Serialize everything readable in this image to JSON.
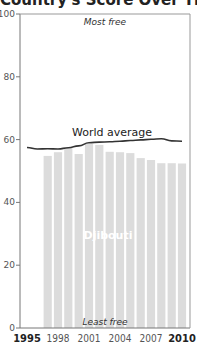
{
  "chart_data": {
    "type": "bar",
    "title": "Country's Score Over Time",
    "xlabel": "",
    "ylabel": "",
    "ylim": [
      0,
      100
    ],
    "yticks": [
      0,
      20,
      40,
      60,
      80,
      100
    ],
    "xtick_labels": [
      "1995",
      "1998",
      "2001",
      "2004",
      "2007",
      "2010"
    ],
    "categories": [
      "1997",
      "1998",
      "1999",
      "2000",
      "2001",
      "2002",
      "2003",
      "2004",
      "2005",
      "2006",
      "2007",
      "2008",
      "2009",
      "2010"
    ],
    "series": [
      {
        "name": "Djibouti",
        "type": "bar",
        "color": "#dcdcdc",
        "values": [
          54.8,
          56.0,
          57.3,
          55.4,
          58.6,
          58.3,
          56.1,
          56.0,
          55.7,
          54.1,
          53.5,
          52.5,
          52.5,
          52.4
        ]
      },
      {
        "name": "World average",
        "type": "line",
        "color": "#333333",
        "x": [
          1995,
          1996,
          1997,
          1998,
          1999,
          2000,
          2001,
          2002,
          2003,
          2004,
          2005,
          2006,
          2007,
          2008,
          2009,
          2010
        ],
        "values": [
          57.5,
          57.0,
          57.1,
          57.0,
          57.4,
          58.0,
          59.0,
          59.2,
          59.3,
          59.5,
          59.7,
          59.9,
          60.1,
          60.3,
          59.6,
          59.5
        ]
      }
    ],
    "annotations": {
      "top": "Most free",
      "bottom": "Least free",
      "line_label": "World average",
      "bar_label": "Djibouti"
    },
    "grid": false,
    "legend": "none"
  }
}
